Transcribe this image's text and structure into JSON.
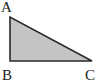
{
  "diagram": {
    "type": "right-triangle",
    "fill_color": "#c4c4c4",
    "stroke_color": "#2a2a2a",
    "vertices": [
      {
        "label": "A",
        "x": 10,
        "y": 17
      },
      {
        "label": "B",
        "x": 10,
        "y": 61
      },
      {
        "label": "C",
        "x": 92,
        "y": 61
      }
    ],
    "right_angle_at": "B"
  }
}
